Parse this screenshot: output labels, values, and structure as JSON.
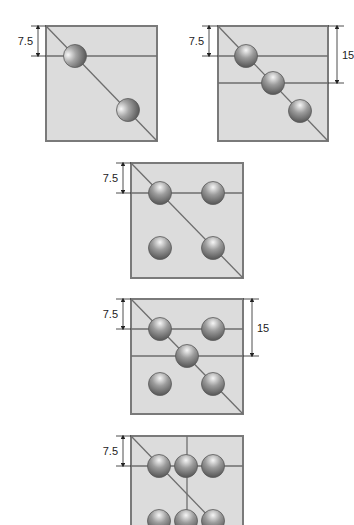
{
  "colors": {
    "background": "#ffffff",
    "box_fill": "#dcdcdc",
    "box_stroke": "#7a7a7a",
    "line": "#6e6e6e",
    "ball_light": "#f4f4f4",
    "ball_mid": "#9a9a9a",
    "ball_dark": "#555555",
    "dim": "#222222"
  },
  "ball_radius": 11.5,
  "figures": [
    {
      "id": "pattern-1",
      "box": {
        "x": 46,
        "y": 26,
        "w": 111,
        "h": 115
      },
      "diagonal": [
        [
          46,
          26
        ],
        [
          157,
          141
        ]
      ],
      "lines": [
        [
          [
            46,
            56
          ],
          [
            157,
            56
          ]
        ]
      ],
      "balls": [
        [
          75,
          56
        ],
        [
          128,
          110
        ]
      ],
      "side_lit": true,
      "dims": [
        {
          "side": "left",
          "x": 38,
          "y1": 26,
          "y2": 56,
          "label": "7.5"
        }
      ]
    },
    {
      "id": "pattern-2",
      "box": {
        "x": 218,
        "y": 26,
        "w": 110,
        "h": 115
      },
      "diagonal": [
        [
          218,
          26
        ],
        [
          328,
          141
        ]
      ],
      "lines": [
        [
          [
            218,
            56
          ],
          [
            328,
            56
          ]
        ],
        [
          [
            218,
            83
          ],
          [
            328,
            83
          ]
        ]
      ],
      "balls": [
        [
          246,
          56
        ],
        [
          273,
          83
        ],
        [
          300,
          111
        ]
      ],
      "side_lit": false,
      "dims": [
        {
          "side": "left",
          "x": 209,
          "y1": 26,
          "y2": 56,
          "label": "7.5"
        },
        {
          "side": "right",
          "x": 337,
          "y1": 26,
          "y2": 83,
          "label": "15"
        }
      ]
    },
    {
      "id": "pattern-3",
      "box": {
        "x": 131,
        "y": 163,
        "w": 112,
        "h": 115
      },
      "diagonal": [
        [
          131,
          163
        ],
        [
          243,
          278
        ]
      ],
      "lines": [
        [
          [
            131,
            193
          ],
          [
            243,
            193
          ]
        ]
      ],
      "balls": [
        [
          160,
          193
        ],
        [
          213,
          193
        ],
        [
          160,
          248
        ],
        [
          213,
          248
        ]
      ],
      "side_lit": false,
      "dims": [
        {
          "side": "left",
          "x": 123,
          "y1": 163,
          "y2": 193,
          "label": "7.5"
        }
      ]
    },
    {
      "id": "pattern-4",
      "box": {
        "x": 131,
        "y": 299,
        "w": 112,
        "h": 115
      },
      "diagonal": [
        [
          131,
          299
        ],
        [
          243,
          414
        ]
      ],
      "lines": [
        [
          [
            131,
            329
          ],
          [
            243,
            329
          ]
        ],
        [
          [
            131,
            356
          ],
          [
            243,
            356
          ]
        ]
      ],
      "balls": [
        [
          160,
          329
        ],
        [
          213,
          329
        ],
        [
          187,
          356
        ],
        [
          160,
          384
        ],
        [
          213,
          384
        ]
      ],
      "side_lit": false,
      "dims": [
        {
          "side": "left",
          "x": 123,
          "y1": 299,
          "y2": 329,
          "label": "7.5"
        },
        {
          "side": "right",
          "x": 252,
          "y1": 299,
          "y2": 356,
          "label": "15"
        }
      ]
    },
    {
      "id": "pattern-5",
      "box": {
        "x": 131,
        "y": 436,
        "w": 112,
        "h": 115
      },
      "diagonal": [
        [
          131,
          436
        ],
        [
          213,
          521
        ]
      ],
      "lines": [
        [
          [
            131,
            466
          ],
          [
            243,
            466
          ]
        ],
        [
          [
            187,
            436
          ],
          [
            187,
            525
          ]
        ]
      ],
      "balls": [
        [
          159,
          466
        ],
        [
          186,
          466
        ],
        [
          213,
          466
        ],
        [
          159,
          521
        ],
        [
          186,
          521
        ],
        [
          213,
          521
        ]
      ],
      "side_lit": false,
      "dims": [
        {
          "side": "left",
          "x": 123,
          "y1": 436,
          "y2": 466,
          "label": "7.5"
        }
      ]
    }
  ]
}
